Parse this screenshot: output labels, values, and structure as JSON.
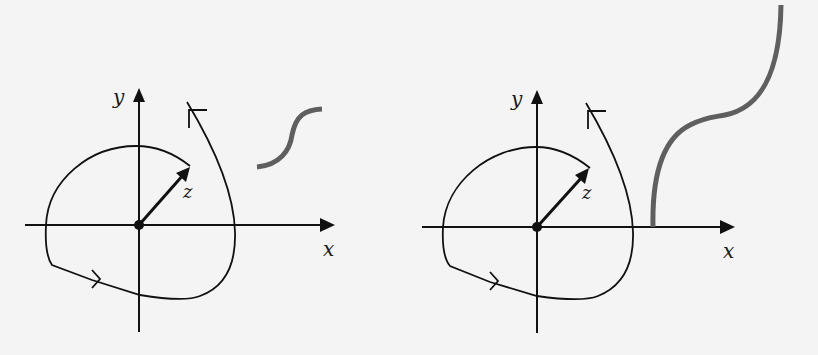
{
  "panels": [
    {
      "id": "left",
      "labels": {
        "x_axis": "x",
        "y_axis": "y",
        "vector": "z"
      },
      "description": "Closed contour around origin with vector z; gray S-shaped curve off to the right (not enclosing origin)"
    },
    {
      "id": "right",
      "labels": {
        "x_axis": "x",
        "y_axis": "y",
        "vector": "z"
      },
      "description": "Same contour with vector z; gray branch-cut curve starting on positive x-axis and extending upward to top edge"
    }
  ],
  "colors": {
    "ink": "#111111",
    "branch_curve": "#5f5f5f",
    "background": "#f4f4f4"
  }
}
